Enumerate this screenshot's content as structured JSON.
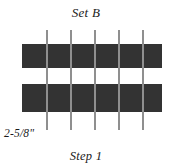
{
  "figure": {
    "title": "Set B",
    "caption": "Step 1",
    "dimension_label": "2-5/8\"",
    "background_color": "#ffffff",
    "strip_color": "#333333",
    "grid_line_color": "#8f8f8f",
    "text_color": "#1a1a1a"
  },
  "diagram": {
    "strips": [
      {
        "name": "top-fabric-strip",
        "x": 22,
        "y": 44,
        "width": 140,
        "height": 24
      },
      {
        "name": "bottom-fabric-strip",
        "x": 22,
        "y": 84,
        "width": 140,
        "height": 28
      }
    ],
    "gap": {
      "name": "white-gap-band",
      "y": 68,
      "height": 16
    },
    "grid_lines": [
      {
        "x": 46,
        "y": 30,
        "height": 100
      },
      {
        "x": 70,
        "y": 30,
        "height": 100
      },
      {
        "x": 94,
        "y": 30,
        "height": 100
      },
      {
        "x": 118,
        "y": 30,
        "height": 100
      },
      {
        "x": 142,
        "y": 30,
        "height": 100
      }
    ],
    "grid_line_count": 5
  }
}
